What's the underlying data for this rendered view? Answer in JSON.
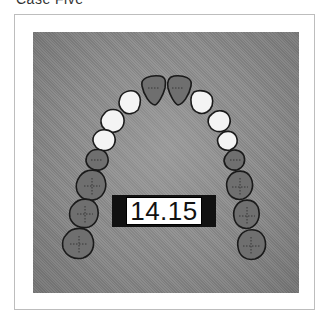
{
  "caption": "Case Five",
  "figure": {
    "measurement_label": "14.15",
    "colors": {
      "background_panel": "#8a8a8a",
      "dark_teeth": "#6f6f6f",
      "highlighted_teeth": "#f4f4f4",
      "outline": "#1a1a1a",
      "label_bar": "#111111",
      "label_box": "#ffffff"
    },
    "teeth": {
      "central_incisors": "dark",
      "lateral_incisors": "white",
      "canines": "white",
      "first_premolars": "white",
      "second_premolars": "dark",
      "first_molars": "dark",
      "second_molars": "dark",
      "third_molars": "dark"
    }
  }
}
